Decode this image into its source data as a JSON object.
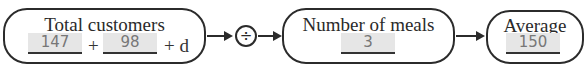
{
  "diagram": {
    "total_customers": {
      "title": "Total customers",
      "value1": "147",
      "plus1": "+",
      "value2": "98",
      "plus2_var": "+ d"
    },
    "operator": {
      "symbol": "÷",
      "icon": "divide-icon"
    },
    "number_of_meals": {
      "title": "Number of meals",
      "value": "3"
    },
    "average": {
      "title": "Average",
      "value": "150"
    }
  }
}
